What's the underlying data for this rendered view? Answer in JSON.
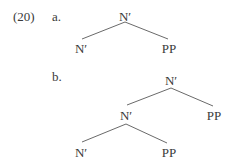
{
  "example": {
    "number": "(20)",
    "a": {
      "label": "a.",
      "root": "N′",
      "left": "N′",
      "right": "PP"
    },
    "b": {
      "label": "b.",
      "root": "N′",
      "mid": "N′",
      "mid_right": "PP",
      "left": "N′",
      "right": "PP"
    }
  }
}
